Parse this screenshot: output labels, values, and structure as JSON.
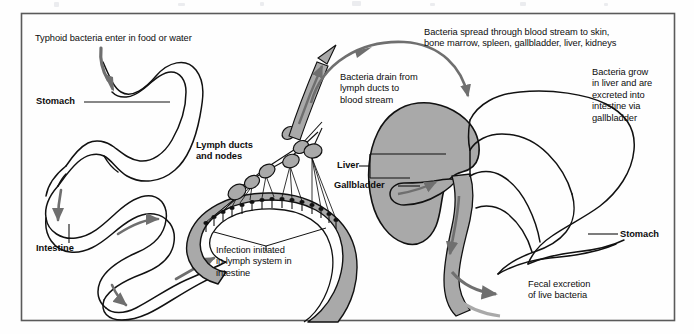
{
  "figure": {
    "frame": {
      "stroke": "#5a5a5a",
      "fill": "#fefefe"
    },
    "colors": {
      "outline": "#111111",
      "organ_fill_gray": "#a9a9a9",
      "arrow_gray": "#6f6f6f",
      "text": "#0d0d0d",
      "background": "#fefefe",
      "frame_border": "#5a5a5a"
    }
  },
  "labels": {
    "entry": {
      "text": "Typhoid bacteria enter in food or water",
      "bold": false,
      "x": 35,
      "y": 38
    },
    "stomach_left": {
      "text": "Stomach",
      "bold": true,
      "x": 36,
      "y": 105
    },
    "intestine": {
      "text": "Intestine",
      "bold": true,
      "x": 36,
      "y": 249
    },
    "lymph_ducts_nodes": {
      "line1": "Lymph ducts",
      "line2": "and nodes",
      "bold": true,
      "x": 196,
      "y": 143
    },
    "infection_initiated": {
      "line1": "Infection initiated",
      "line2": "in lymph system in",
      "line3": "intestine",
      "bold": false,
      "x": 216,
      "y": 249
    },
    "bacteria_drain": {
      "line1": "Bacteria drain from",
      "line2": "lymph ducts to",
      "line3": "blood stream",
      "bold": false,
      "x": 340,
      "y": 77
    },
    "bacteria_spread": {
      "line1": "Bacteria spread through blood stream to skin,",
      "line2": "bone marrow, spleen, gallbladder, liver, kidneys",
      "bold": false,
      "x": 424,
      "y": 31
    },
    "bacteria_grow": {
      "line1": "Bacteria grow",
      "line2": "in liver and are",
      "line3": "excreted into",
      "line4": "intestine via",
      "line5": "gallbladder",
      "bold": false,
      "x": 592,
      "y": 70
    },
    "liver": {
      "text": "Liver",
      "bold": true,
      "x": 339,
      "y": 158
    },
    "gallbladder": {
      "text": "Gallbladder",
      "bold": true,
      "x": 339,
      "y": 186
    },
    "stomach_right": {
      "text": "Stomach",
      "bold": true,
      "x": 622,
      "y": 237
    },
    "fecal_excretion": {
      "line1": "Fecal excretion",
      "line2": "of live bacteria",
      "bold": false,
      "x": 528,
      "y": 283
    }
  },
  "diagram_elements": [
    {
      "name": "left-stomach-organ",
      "description": "Outline of stomach receiving ingested bacteria"
    },
    {
      "name": "left-intestine-organ",
      "description": "Coiled intestine outline with directional flow arrows"
    },
    {
      "name": "ingestion-arrow",
      "description": "Downward arrow entering the stomach from food or water"
    },
    {
      "name": "lymph-node-cluster",
      "description": "Gray ovoid lymph nodes connected by ducts above the intestine wall"
    },
    {
      "name": "lymph-duct-trunk-arrow",
      "description": "Gray ascending arrow carrying bacteria from lymph ducts to blood stream"
    },
    {
      "name": "blood-stream-arc-arrow",
      "description": "Large curved arrow spanning the top from lymph trunk to the liver"
    },
    {
      "name": "liver-organ",
      "description": "Gray filled liver lobe"
    },
    {
      "name": "gallbladder-organ",
      "description": "Small sac attached beneath the liver with efflux arrow"
    },
    {
      "name": "right-stomach-organ",
      "description": "Outline of stomach and duodenum on the right side"
    },
    {
      "name": "bile-duct-flow-arrow",
      "description": "Gray band descending from gallbladder into the intestine"
    },
    {
      "name": "fecal-excretion-arrow",
      "description": "Gray arrow exiting the lower intestine to the right"
    }
  ]
}
